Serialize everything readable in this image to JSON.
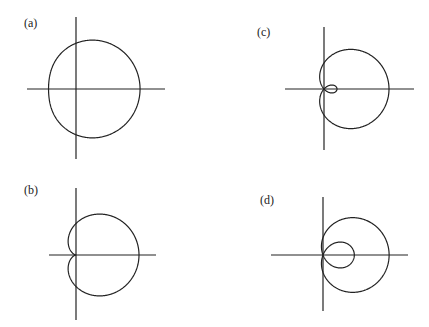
{
  "panels": [
    {
      "label": "(a)",
      "label_pos": [
        24,
        28
      ],
      "origin": [
        76,
        89
      ],
      "axes": {
        "x": [
          27,
          165
        ],
        "y": [
          17,
          159
        ]
      },
      "curve": {
        "b": 2.5,
        "a": 1,
        "scale": 18.3
      }
    },
    {
      "label": "(b)",
      "label_pos": [
        24,
        195
      ],
      "origin": [
        76,
        255
      ],
      "axes": {
        "x": [
          49,
          156
        ],
        "y": [
          188,
          320
        ]
      },
      "curve": {
        "b": 1,
        "a": 1,
        "scale": 31.5
      }
    },
    {
      "label": "(c)",
      "label_pos": [
        257,
        37
      ],
      "origin": [
        324,
        89
      ],
      "axes": {
        "x": [
          285,
          414
        ],
        "y": [
          27,
          150
        ]
      },
      "curve": {
        "b": 1,
        "a": 1.5,
        "scale": 26
      }
    },
    {
      "label": "(d)",
      "label_pos": [
        260,
        205
      ],
      "origin": [
        323,
        255
      ],
      "axes": {
        "x": [
          271,
          408
        ],
        "y": [
          197,
          311
        ]
      },
      "curve": {
        "b": 1,
        "a": 2.8,
        "scale": 17.4
      }
    }
  ],
  "colors": {
    "stroke": "#222222",
    "background": "#ffffff"
  },
  "chart_data": {
    "type": "line",
    "title": "",
    "series": [
      {
        "name": "(a)",
        "form": "r = b + a cos(theta)",
        "b": 2.5,
        "a": 1,
        "shape": "dimpled limacon (no inner loop)"
      },
      {
        "name": "(b)",
        "form": "r = b + a cos(theta)",
        "b": 1,
        "a": 1,
        "shape": "cardioid"
      },
      {
        "name": "(c)",
        "form": "r = b + a cos(theta)",
        "b": 1,
        "a": 1.5,
        "shape": "limacon with small inner loop"
      },
      {
        "name": "(d)",
        "form": "r = b + a cos(theta)",
        "b": 1,
        "a": 2.8,
        "shape": "limacon with large inner loop"
      }
    ],
    "xlabel": "",
    "ylabel": "",
    "grid": false
  }
}
